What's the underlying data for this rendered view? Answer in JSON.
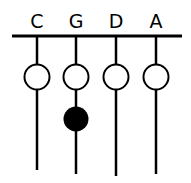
{
  "diagram": {
    "strings": [
      {
        "label": "C",
        "x": 37,
        "end": 170
      },
      {
        "label": "G",
        "x": 76,
        "end": 174
      },
      {
        "label": "D",
        "x": 116,
        "end": 176
      },
      {
        "label": "A",
        "x": 156,
        "end": 174
      }
    ],
    "open_circles_y": 77,
    "fingered": [
      {
        "string": "G",
        "y": 119
      }
    ],
    "colors": {
      "ink": "#000000",
      "bg": "#ffffff"
    }
  }
}
